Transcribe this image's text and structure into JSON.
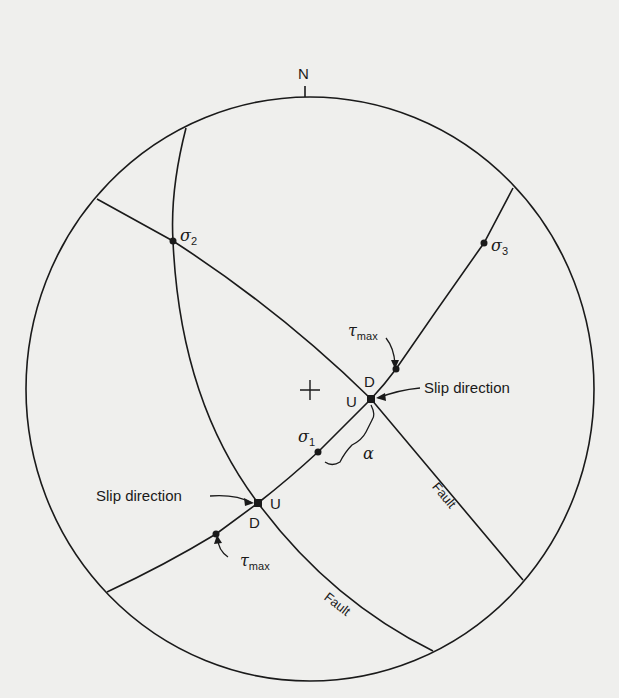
{
  "diagram": {
    "type": "stereonet",
    "north_label": "N",
    "center_mark": "+",
    "points": {
      "sigma1": {
        "symbol": "σ",
        "sub": "1"
      },
      "sigma2": {
        "symbol": "σ",
        "sub": "2"
      },
      "sigma3": {
        "symbol": "σ",
        "sub": "3"
      },
      "tau_max_upper": {
        "symbol": "τ",
        "sub": "max"
      },
      "tau_max_lower": {
        "symbol": "τ",
        "sub": "max"
      }
    },
    "angle_label": "α",
    "slip_upper": {
      "label": "Slip direction",
      "up": "U",
      "down": "D"
    },
    "slip_lower": {
      "label": "Slip direction",
      "up": "U",
      "down": "D"
    },
    "fault_labels": [
      "Fault",
      "Fault"
    ],
    "colors": {
      "line": "#1a1a1a",
      "background": "#efefed"
    }
  }
}
